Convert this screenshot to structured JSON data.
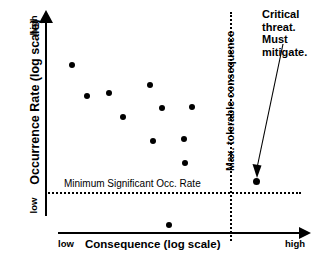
{
  "axes": {
    "y_title": "Occurrence Rate (log scale)",
    "y_low": "low",
    "y_high": "high",
    "x_title": "Consequence (log scale)",
    "x_low": "low",
    "x_high": "high"
  },
  "thresholds": {
    "min_occurrence_label": "Minimum Significant Occ. Rate",
    "max_consequence_label": "Max. tolerable consequence"
  },
  "annotation": {
    "line1": "Critical",
    "line2": "threat.",
    "line3": "Must",
    "line4": "mitigate.",
    "full_text": "Critical threat. Must mitigate."
  },
  "colors": {
    "ink": "#000000",
    "background": "#ffffff"
  },
  "chart_data": {
    "type": "scatter",
    "title": "",
    "xlabel": "Consequence (log scale)",
    "ylabel": "Occurrence Rate (log scale)",
    "xlim": [
      "low",
      "high"
    ],
    "ylim": [
      "low",
      "high"
    ],
    "grid": false,
    "legend": "none",
    "threshold_lines": [
      {
        "orientation": "horizontal",
        "label": "Minimum Significant Occ. Rate",
        "style": "dotted",
        "y_px": 193
      },
      {
        "orientation": "vertical",
        "label": "Max. tolerable consequence",
        "style": "dotted",
        "x_px": 231
      }
    ],
    "points": [
      {
        "x_px": 72,
        "y_px": 65,
        "critical": false
      },
      {
        "x_px": 87,
        "y_px": 96,
        "critical": false
      },
      {
        "x_px": 109,
        "y_px": 93,
        "critical": false
      },
      {
        "x_px": 123,
        "y_px": 117,
        "critical": false
      },
      {
        "x_px": 150,
        "y_px": 85,
        "critical": false
      },
      {
        "x_px": 162,
        "y_px": 108,
        "critical": false
      },
      {
        "x_px": 192,
        "y_px": 107,
        "critical": false
      },
      {
        "x_px": 153,
        "y_px": 141,
        "critical": false
      },
      {
        "x_px": 184,
        "y_px": 139,
        "critical": false
      },
      {
        "x_px": 185,
        "y_px": 163,
        "critical": false
      },
      {
        "x_px": 169,
        "y_px": 225,
        "critical": false
      },
      {
        "x_px": 256,
        "y_px": 181,
        "critical": true
      }
    ],
    "annotations": [
      {
        "text": "Critical threat. Must mitigate.",
        "points_to_x_px": 256,
        "points_to_y_px": 176
      }
    ]
  }
}
